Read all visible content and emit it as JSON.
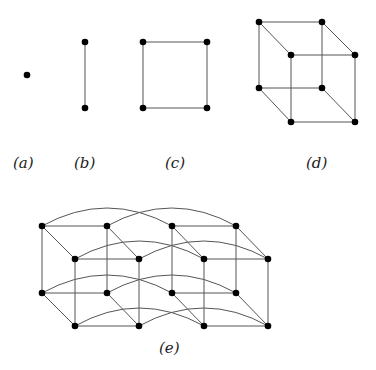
{
  "labels": {
    "a": "(a)",
    "b": "(b)",
    "c": "(c)",
    "d": "(d)",
    "e": "(e)"
  },
  "colors": {
    "edge": "#555555",
    "node": "#000000"
  },
  "panels": [
    {
      "id": "a",
      "nodes": 1,
      "edges": 0
    },
    {
      "id": "b",
      "nodes": 2,
      "edges": 1
    },
    {
      "id": "c",
      "nodes": 4,
      "edges": 4
    },
    {
      "id": "d",
      "nodes": 8,
      "edges": 12
    },
    {
      "id": "e",
      "nodes": 16,
      "edges": 32
    }
  ]
}
